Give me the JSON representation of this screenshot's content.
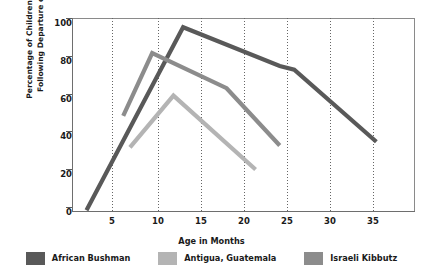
{
  "chart_data": {
    "type": "line",
    "title": "",
    "xlabel": "Age in Months",
    "ylabel": "Percentage of Children Who Cried Following Departure of Mother",
    "ylabel_line1": "Percentage of Children Who Cried",
    "ylabel_line2": "Following Departure of Mother",
    "xlim": [
      3.5,
      39
    ],
    "ylim": [
      0,
      105
    ],
    "xticks": [
      5,
      10,
      15,
      20,
      25,
      30,
      35
    ],
    "xtick_labels": [
      "5",
      "10",
      "15",
      "20",
      "25",
      "30",
      "35"
    ],
    "yticks": [
      0,
      20,
      40,
      60,
      80,
      100
    ],
    "ytick_labels": [
      "0",
      "20",
      "40",
      "60",
      "80",
      "100"
    ],
    "grid": "vertical-dotted",
    "legend_position": "below",
    "series": [
      {
        "name": "African Bushman",
        "color": "#595959",
        "x": [
          5,
          15,
          25,
          26.5,
          35
        ],
        "y": [
          1,
          100,
          79,
          77,
          38
        ]
      },
      {
        "name": "Antigua, Guatemala",
        "color": "#b4b4b4",
        "x": [
          9.5,
          14,
          22.5
        ],
        "y": [
          35,
          63,
          23
        ]
      },
      {
        "name": "Israeli Kibbutz",
        "color": "#8c8c8c",
        "x": [
          8.8,
          11.8,
          19.5,
          25
        ],
        "y": [
          52,
          86,
          67,
          36
        ]
      }
    ]
  },
  "axis": {
    "x_title": "Age in Months",
    "y_title_line1": "Percentage of Children Who Cried",
    "y_title_line2": "Following Departure of Mother",
    "x_tick_labels": [
      "5",
      "10",
      "15",
      "20",
      "25",
      "30",
      "35"
    ],
    "y_tick_labels": [
      "100",
      "80",
      "60",
      "40",
      "20",
      "0"
    ]
  },
  "legend": {
    "items": [
      {
        "label": "African Bushman",
        "color": "#595959"
      },
      {
        "label": "Antigua, Guatemala",
        "color": "#b4b4b4"
      },
      {
        "label": "Israeli Kibbutz",
        "color": "#8c8c8c"
      }
    ]
  },
  "colors": {
    "background": "#ffffff",
    "frame": "#8a8a8a",
    "grid": "#666666",
    "text": "#1a1a1a"
  }
}
